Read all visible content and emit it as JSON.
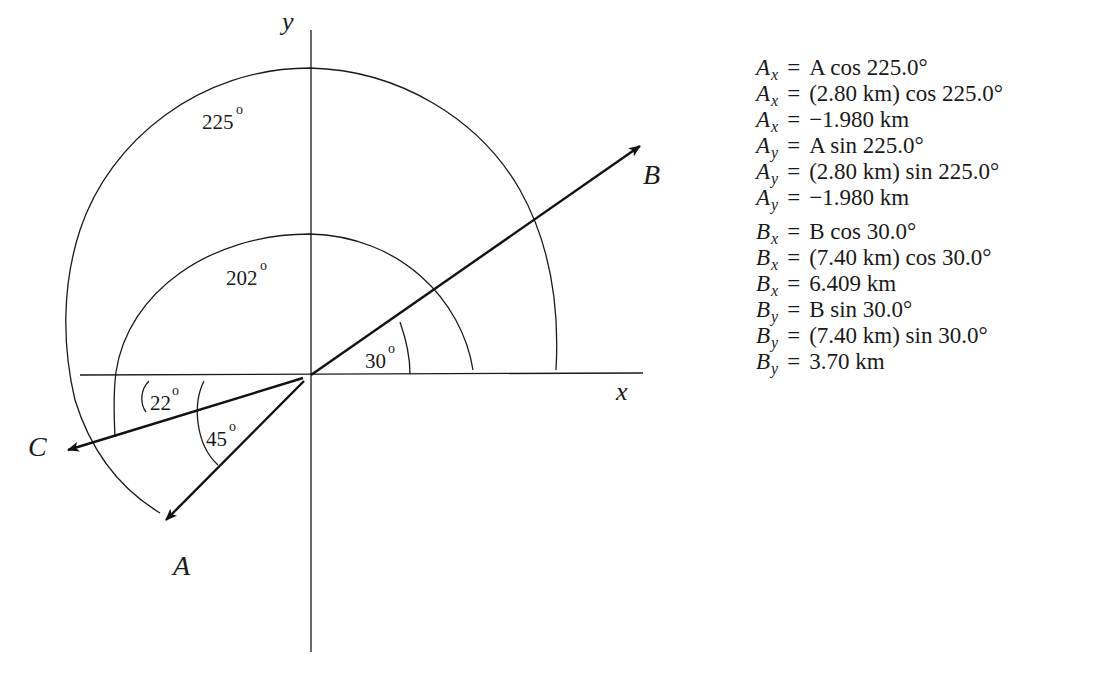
{
  "diagram": {
    "axes": {
      "x_label": "x",
      "y_label": "y"
    },
    "vectors": [
      {
        "name": "A",
        "label": "A",
        "angle_from_neg_x_below_deg": 45,
        "direction_deg": 225
      },
      {
        "name": "B",
        "label": "B",
        "angle_from_pos_x_deg": 30,
        "direction_deg": 30
      },
      {
        "name": "C",
        "label": "C",
        "angle_from_neg_x_below_deg": 22,
        "direction_deg": 202
      }
    ],
    "angle_labels": {
      "outer_arc": "225",
      "inner_arc": "202",
      "b_angle": "30",
      "c_angle": "22",
      "a_angle": "45",
      "degree_symbol": "o"
    }
  },
  "equations": {
    "groups": [
      {
        "name": "A-components",
        "lines": [
          {
            "var": "A",
            "sub": "x",
            "rhs": "A cos 225.0°"
          },
          {
            "var": "A",
            "sub": "x",
            "rhs": "(2.80 km) cos 225.0°"
          },
          {
            "var": "A",
            "sub": "x",
            "rhs": "−1.980 km"
          },
          {
            "var": "A",
            "sub": "y",
            "rhs": "A sin 225.0°"
          },
          {
            "var": "A",
            "sub": "y",
            "rhs": "(2.80 km) sin 225.0°"
          },
          {
            "var": "A",
            "sub": "y",
            "rhs": "−1.980 km"
          }
        ]
      },
      {
        "name": "B-components",
        "lines": [
          {
            "var": "B",
            "sub": "x",
            "rhs": "B cos 30.0°"
          },
          {
            "var": "B",
            "sub": "x",
            "rhs": "(7.40 km) cos 30.0°"
          },
          {
            "var": "B",
            "sub": "x",
            "rhs": "6.409 km"
          },
          {
            "var": "B",
            "sub": "y",
            "rhs": "B sin 30.0°"
          },
          {
            "var": "B",
            "sub": "y",
            "rhs": "(7.40 km) sin 30.0°"
          },
          {
            "var": "B",
            "sub": "y",
            "rhs": "3.70 km"
          }
        ]
      }
    ],
    "equals": "="
  }
}
